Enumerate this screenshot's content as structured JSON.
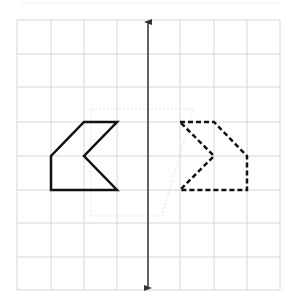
{
  "diagram": {
    "type": "reflection-over-line",
    "grid": {
      "columns": 8,
      "rows": 8,
      "x_lines": [
        17,
        51,
        84,
        117,
        148,
        180,
        214,
        247,
        280
      ],
      "y_lines": [
        20,
        54,
        87,
        122,
        156,
        190,
        223,
        257,
        290
      ],
      "line_color": "#d6d6d6"
    },
    "line_of_reflection": {
      "orientation": "vertical",
      "x": 148,
      "y_start": 20,
      "y_end": 290,
      "arrows": "both",
      "color": "#333333"
    },
    "original_shape": {
      "style": "solid",
      "color": "#111111",
      "points": "84,122 117,122 84,156 117,190 51,190 51,156"
    },
    "reflected_shape": {
      "style": "dashed",
      "color": "#111111",
      "points": "180,122 214,122 247,156 247,190 180,190 214,156"
    },
    "ghost_marks": {
      "color": "#e4e4e4",
      "path": "M91,109 L193,109 L162,216 L91,216 Z"
    }
  }
}
